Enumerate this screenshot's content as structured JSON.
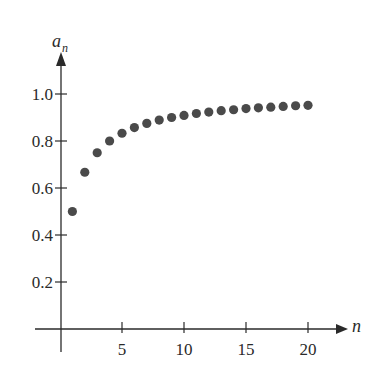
{
  "chart_data": {
    "type": "scatter",
    "title": "",
    "xlabel": "n",
    "ylabel": "a_n",
    "ylabel_main": "a",
    "ylabel_sub": "n",
    "x": [
      1,
      2,
      3,
      4,
      5,
      6,
      7,
      8,
      9,
      10,
      11,
      12,
      13,
      14,
      15,
      16,
      17,
      18,
      19,
      20
    ],
    "series": [
      {
        "name": "a_n",
        "values": [
          0.5,
          0.667,
          0.75,
          0.8,
          0.833,
          0.857,
          0.875,
          0.889,
          0.9,
          0.909,
          0.917,
          0.923,
          0.929,
          0.933,
          0.938,
          0.941,
          0.944,
          0.947,
          0.95,
          0.952
        ]
      }
    ],
    "xticks": [
      5,
      10,
      15,
      20
    ],
    "xtick_labels": [
      "5",
      "10",
      "15",
      "20"
    ],
    "yticks": [
      0.2,
      0.4,
      0.6,
      0.8,
      1.0
    ],
    "ytick_labels": [
      "0.2",
      "0.4",
      "0.6",
      "0.8",
      "1.0"
    ],
    "xlim": [
      0,
      22
    ],
    "ylim": [
      0,
      1.1
    ],
    "grid": false,
    "legend": "none",
    "marker_color": "#4a4a4a",
    "axis_color": "#2a2a2a"
  }
}
